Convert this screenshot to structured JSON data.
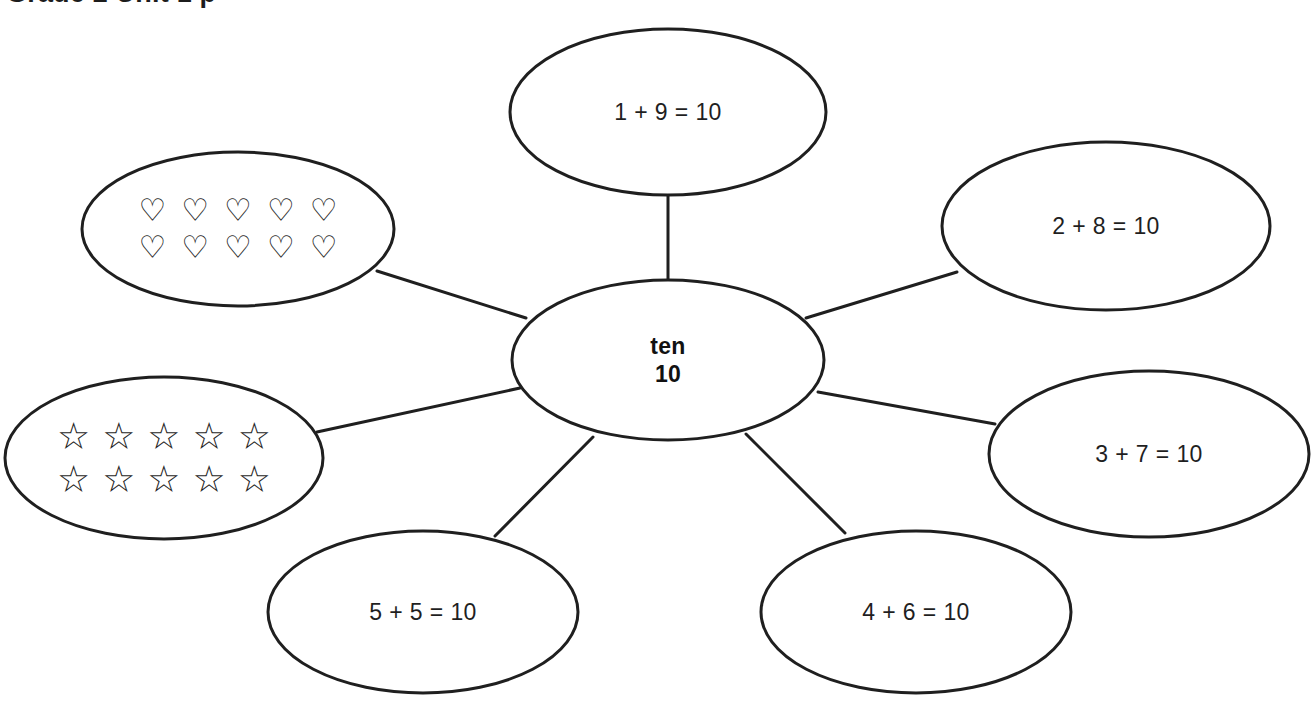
{
  "page": {
    "title_partial": "Grade 2 Unit 1 p",
    "background_color": "#ffffff",
    "stroke_color": "#1f1f1f",
    "text_color": "#1f1f1f",
    "width": 1313,
    "height": 708
  },
  "diagram": {
    "type": "concept-map",
    "center": {
      "id": "center",
      "line1": "ten",
      "line2": "10",
      "cx": 668,
      "cy": 360,
      "rx": 156,
      "ry": 80
    },
    "nodes": [
      {
        "id": "top",
        "kind": "equation",
        "label": "1 + 9 = 10",
        "cx": 668,
        "cy": 112,
        "rx": 158,
        "ry": 83
      },
      {
        "id": "upper-right",
        "kind": "equation",
        "label": "2 + 8 = 10",
        "cx": 1106,
        "cy": 226,
        "rx": 164,
        "ry": 84
      },
      {
        "id": "right",
        "kind": "equation",
        "label": "3 + 7 = 10",
        "cx": 1149,
        "cy": 454,
        "rx": 160,
        "ry": 83
      },
      {
        "id": "lower-right",
        "kind": "equation",
        "label": "4 + 6 = 10",
        "cx": 916,
        "cy": 612,
        "rx": 155,
        "ry": 81
      },
      {
        "id": "lower-left",
        "kind": "equation",
        "label": "5 + 5 = 10",
        "cx": 423,
        "cy": 612,
        "rx": 155,
        "ry": 81
      },
      {
        "id": "left",
        "kind": "glyphs",
        "glyph": "star-outline",
        "glyph_char": "☆",
        "glyph_count": 10,
        "glyph_rows": 2,
        "glyph_cols": 5,
        "cx": 164,
        "cy": 458,
        "rx": 159,
        "ry": 81
      },
      {
        "id": "upper-left",
        "kind": "glyphs",
        "glyph": "heart-outline",
        "glyph_char": "♡",
        "glyph_count": 10,
        "glyph_rows": 2,
        "glyph_cols": 5,
        "cx": 238,
        "cy": 229,
        "rx": 156,
        "ry": 77
      }
    ],
    "connectors": [
      {
        "from": "center",
        "to": "top",
        "x1": 668,
        "y1": 281,
        "x2": 668,
        "y2": 196
      },
      {
        "from": "center",
        "to": "upper-right",
        "x1": 806,
        "y1": 318,
        "x2": 957,
        "y2": 272
      },
      {
        "from": "center",
        "to": "right",
        "x1": 818,
        "y1": 392,
        "x2": 995,
        "y2": 424
      },
      {
        "from": "center",
        "to": "lower-right",
        "x1": 746,
        "y1": 434,
        "x2": 845,
        "y2": 533
      },
      {
        "from": "center",
        "to": "lower-left",
        "x1": 593,
        "y1": 437,
        "x2": 495,
        "y2": 536
      },
      {
        "from": "center",
        "to": "left",
        "x1": 520,
        "y1": 388,
        "x2": 317,
        "y2": 432
      },
      {
        "from": "center",
        "to": "upper-left",
        "x1": 526,
        "y1": 318,
        "x2": 377,
        "y2": 271
      }
    ]
  }
}
